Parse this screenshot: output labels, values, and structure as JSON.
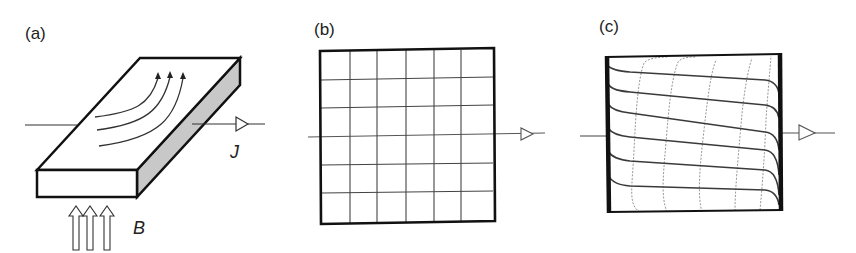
{
  "panels": [
    {
      "id": "a",
      "label": "(a)",
      "description": "Conducting slab in perpendicular magnetic field with curved current flow lines",
      "variables": {
        "current": "J",
        "field": "B"
      }
    },
    {
      "id": "b",
      "label": "(b)",
      "description": "Square conductor with uniform orthogonal grid of current and equipotential lines"
    },
    {
      "id": "c",
      "label": "(c)",
      "description": "Square conductor with Hall-angle distorted current lines and skewed equipotentials"
    }
  ],
  "colors": {
    "line": "#222222",
    "side_face": "#c8c8c8",
    "equipotential": "#8a8a8a"
  }
}
